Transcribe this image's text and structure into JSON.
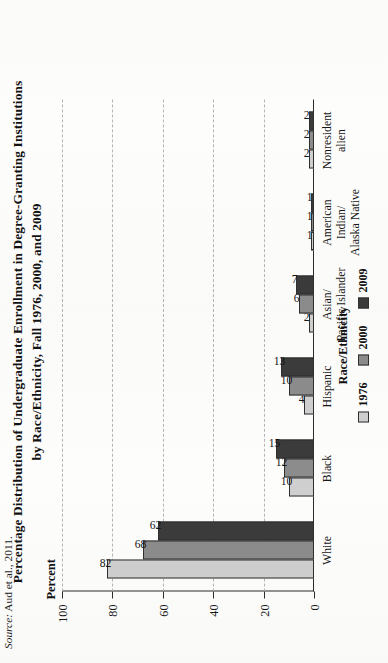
{
  "figure": {
    "title_line1": "Percentage Distribution of Undergraduate Enrollment in Degree-Granting Institutions",
    "title_line2": "by Race/Ethnicity, Fall 1976, 2000, and 2009",
    "source_prefix": "Source:",
    "source_text": " Aud et al., 2011."
  },
  "legend": {
    "title": "Race/Ethnicity",
    "items": [
      {
        "label": "1976",
        "color": "#cfcfcf"
      },
      {
        "label": "2000",
        "color": "#8c8c8c"
      },
      {
        "label": "2009",
        "color": "#3b3b3b"
      }
    ]
  },
  "axes": {
    "y_title": "Percent",
    "y_ticks": [
      "100",
      "80",
      "60",
      "40",
      "20",
      "0"
    ]
  },
  "chart_data": {
    "type": "bar",
    "title": "Percentage Distribution of Undergraduate Enrollment in Degree-Granting Institutions by Race/Ethnicity, Fall 1976, 2000, and 2009",
    "xlabel": "Race/Ethnicity",
    "ylabel": "Percent",
    "ylim": [
      0,
      100
    ],
    "ytick_values": [
      100,
      80,
      60,
      40,
      20,
      0
    ],
    "grid": true,
    "orientation": "vertical-bars-on-rotated-page",
    "legend_position": "below-plot",
    "legend_title": "Race/Ethnicity",
    "categories": [
      "White",
      "Black",
      "Hispanic",
      "Asian/\nPacific Islander",
      "American Indian/\nAlaska Native",
      "Nonresident alien"
    ],
    "series": [
      {
        "name": "1976",
        "color": "#cfcfcf",
        "values": [
          82,
          10,
          4,
          2,
          1,
          2
        ]
      },
      {
        "name": "2000",
        "color": "#8c8c8c",
        "values": [
          68,
          12,
          10,
          6,
          1,
          2
        ]
      },
      {
        "name": "2009",
        "color": "#3b3b3b",
        "values": [
          62,
          15,
          13,
          7,
          1,
          2
        ]
      }
    ],
    "data_labels": {
      "White": {
        "1976": "82",
        "2000": "68",
        "2009": "62"
      },
      "Black": {
        "1976": "10",
        "2000": "12",
        "2009": "15"
      },
      "Hispanic": {
        "1976": "4",
        "2000": "10",
        "2009": "13"
      },
      "Asian/Pacific Islander": {
        "1976": "2",
        "2000": "6",
        "2009": "7"
      },
      "American Indian/Alaska Native": {
        "1976": "1",
        "2000": "1",
        "2009": "1"
      },
      "Nonresident alien": {
        "1976": "2",
        "2000": "2",
        "2009": "2"
      }
    },
    "source": "Source: Aud et al., 2011."
  }
}
